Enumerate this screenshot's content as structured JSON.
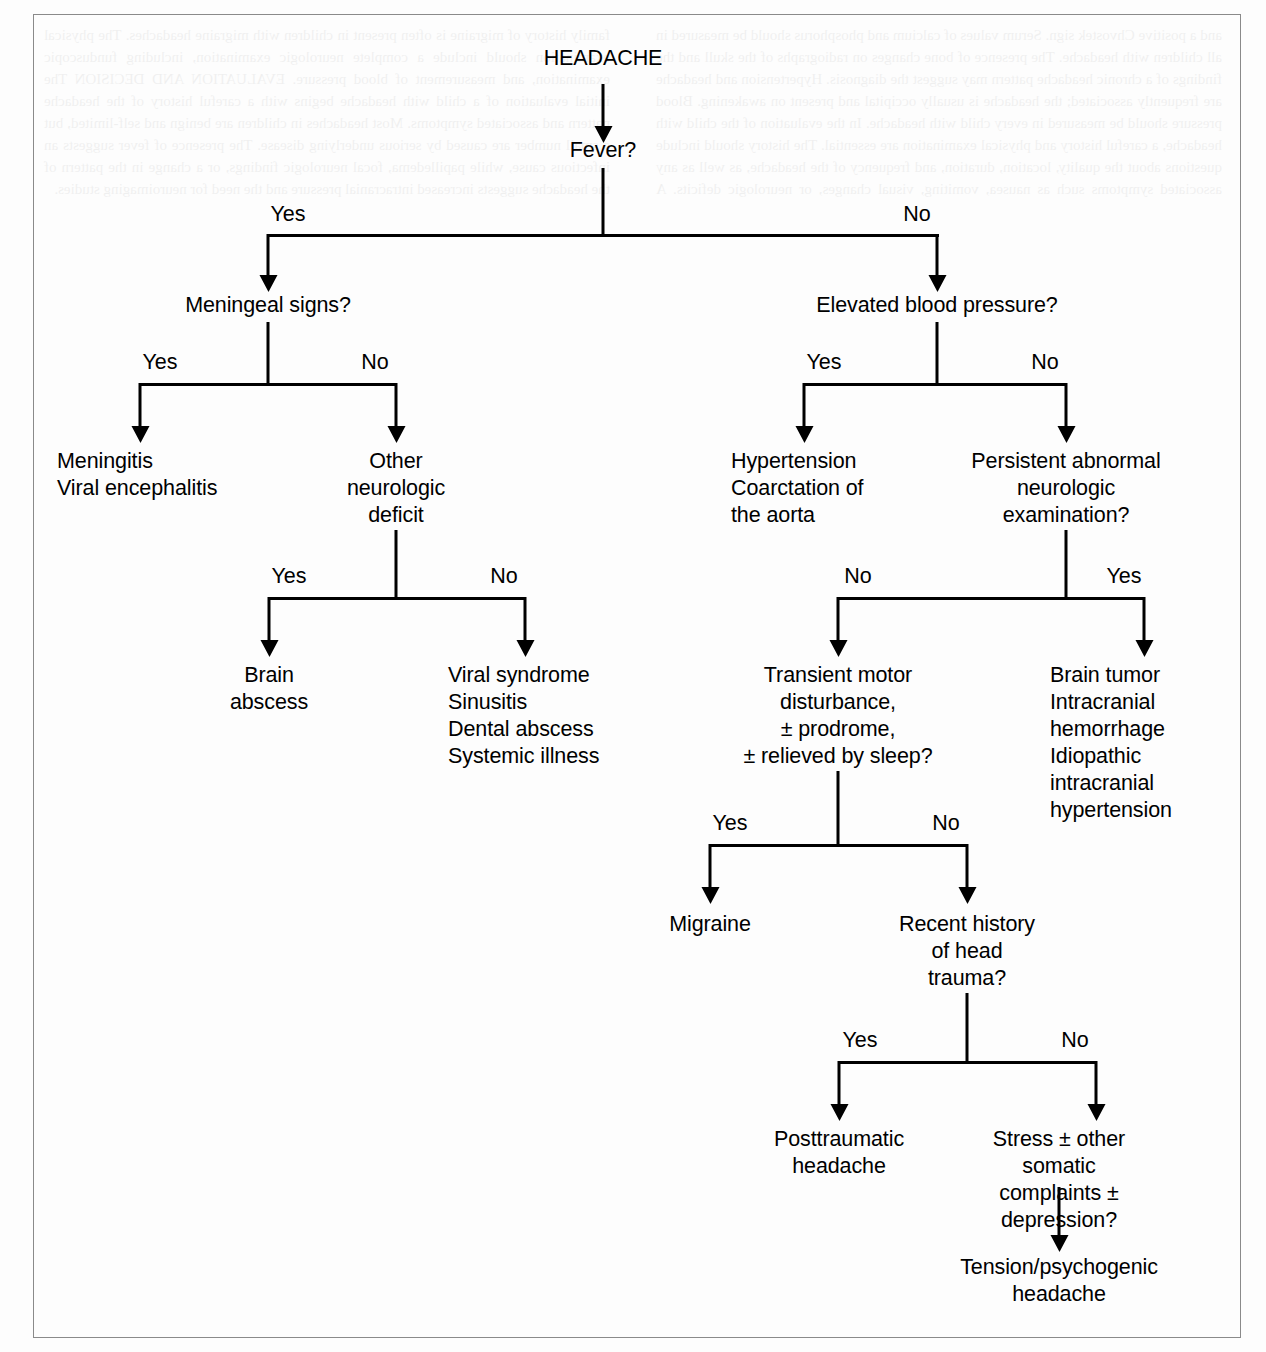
{
  "figure": {
    "type": "flowchart",
    "title": "HEADACHE",
    "domain": "clinical decision tree",
    "frame_color": "#8a8a8a",
    "line_color": "#000000",
    "background": "#fdfdfd"
  },
  "nodes": {
    "root": "HEADACHE",
    "fever": "Fever?",
    "meningeal": "Meningeal signs?",
    "meningitis": "Meningitis\nViral encephalitis",
    "other_neuro_deficit": "Other\nneurologic\ndeficit",
    "brain_abscess": "Brain\nabscess",
    "viral_syndrome": "Viral syndrome\nSinusitis\nDental abscess\nSystemic illness",
    "elevated_bp": "Elevated blood pressure?",
    "hypertension": "Hypertension\nCoarctation of\nthe aorta",
    "persistent_abnormal": "Persistent abnormal\nneurologic\nexamination?",
    "transient_motor": "Transient motor\ndisturbance,\n± prodrome,\n± relieved by sleep?",
    "brain_tumor": "Brain tumor\nIntracranial\nhemorrhage\nIdiopathic\nintracranial\nhypertension",
    "migraine": "Migraine",
    "head_trauma": "Recent history\nof head\ntrauma?",
    "posttraumatic": "Posttraumatic\nheadache",
    "stress": "Stress ± other somatic\ncomplaints ± depression?",
    "tension": "Tension/psychogenic\nheadache"
  },
  "edge_labels": {
    "fever_yes": "Yes",
    "fever_no": "No",
    "meningeal_yes": "Yes",
    "meningeal_no": "No",
    "neuro_deficit_yes": "Yes",
    "neuro_deficit_no": "No",
    "bp_yes": "Yes",
    "bp_no": "No",
    "persistent_no": "No",
    "persistent_yes": "Yes",
    "transient_yes": "Yes",
    "transient_no": "No",
    "trauma_yes": "Yes",
    "trauma_no": "No"
  },
  "bleed_text": "and a positive Chvostek sign. Serum values of calcium and phosphorus should be measured in all children with headache. The presence of bone changes on radiographs of the skull and the findings of a chronic headache pattern may suggest the diagnosis. Hypertension and headache are frequently associated; the headache is usually occipital and present on awakening. Blood pressure should be measured in every child with headache. In the evaluation of the child with headache, a careful history and physical examination are essential. The history should include questions about the quality, location, duration, and frequency of the headache, as well as any associated symptoms such as nausea, vomiting, visual changes, or neurologic deficits. A family history of migraine is often present in children with migraine headaches. The physical examination should include a complete neurologic examination, including funduscopic examination, and measurement of blood pressure. EVALUATION AND DECISION The initial evaluation of a child with headache begins with a careful history of the headache pattern and associated symptoms. Most headaches in children are benign and self-limited, but a small number are caused by serious underlying disease. The presence of fever suggests an infectious cause, while papilledema, focal neurologic findings, or a change in the pattern of the headache suggests increased intracranial pressure and the need for neuroimaging studies."
}
